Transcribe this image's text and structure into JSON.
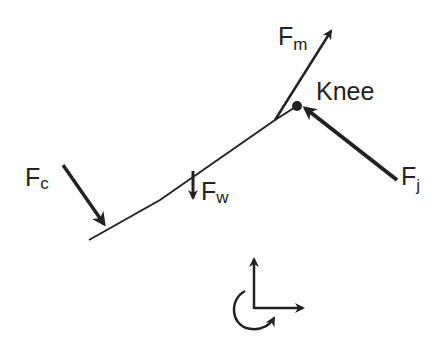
{
  "diagram": {
    "type": "free-body-diagram",
    "colors": {
      "ink": "#222222",
      "background": "#ffffff"
    },
    "labels": {
      "knee": "Knee",
      "muscle_force": {
        "main": "F",
        "sub": "m"
      },
      "joint_force": {
        "main": "F",
        "sub": "j"
      },
      "contact_force": {
        "main": "F",
        "sub": "c"
      },
      "weight_force": {
        "main": "F",
        "sub": "w"
      }
    },
    "coordinate_system": {
      "axes": [
        "x",
        "y"
      ],
      "rotation_direction": "counterclockwise-positive"
    }
  }
}
